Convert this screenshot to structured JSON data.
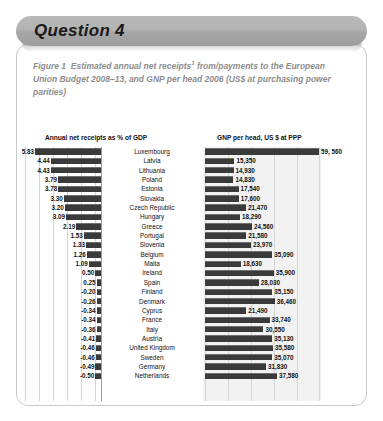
{
  "banner": {
    "title": "Question 4"
  },
  "caption": {
    "figure_label": "Figure 1",
    "text_before_sup": "Estimated annual net receipts",
    "sup": "1",
    "text_after_sup": " from/payments to the European Union Budget 2008–13, and GNP per head 2006 (US$ at purchasing power parities)"
  },
  "chart_data": {
    "type": "bar",
    "panels": [
      {
        "header": "Annual net receipts as % of GDP",
        "unit": "% of GDP",
        "xlabel": "",
        "ylabel": "",
        "xlim": [
          -0.6,
          6.0
        ],
        "grid": true
      },
      {
        "header": "GNP per head, US $ at PPP",
        "unit": "US $ at PPP",
        "xlabel": "",
        "ylabel": "",
        "xlim": [
          0,
          60000
        ],
        "grid": true
      }
    ],
    "categories": [
      "Luxembourg",
      "Latvia",
      "Lithuania",
      "Poland",
      "Estonia",
      "Slovakia",
      "Czech Republic",
      "Hungary",
      "Greece",
      "Portugal",
      "Slovenia",
      "Belgium",
      "Malta",
      "Ireland",
      "Spain",
      "Finland",
      "Denmark",
      "Cyprus",
      "France",
      "Italy",
      "Austria",
      "United Kingdom",
      "Sweden",
      "Germany",
      "Netherlands"
    ],
    "series": [
      {
        "name": "Annual net receipts as % of GDP",
        "values": [
          5.83,
          4.44,
          4.43,
          3.79,
          3.78,
          3.3,
          3.2,
          3.09,
          2.19,
          1.53,
          1.33,
          1.26,
          1.09,
          0.5,
          0.25,
          -0.2,
          -0.26,
          -0.34,
          -0.34,
          -0.36,
          -0.41,
          -0.46,
          -0.46,
          -0.49,
          -0.5
        ],
        "labels": [
          "5.83",
          "4.44",
          "4.43",
          "3.79",
          "3.78",
          "3.30",
          "3.20",
          "3.09",
          "2.19",
          "1.53",
          "1.33",
          "1.26",
          "1.09",
          "0.50",
          "0.25",
          "-0.20",
          "-0.26",
          "-0.34",
          "-0.34",
          "-0.36",
          "-0.41",
          "-0.46",
          "-0.46",
          "-0.49",
          "-0.50"
        ]
      },
      {
        "name": "GNP per head, US $ at PPP",
        "values": [
          59560,
          15350,
          14930,
          14830,
          17540,
          17600,
          21470,
          18290,
          24560,
          21580,
          23970,
          35090,
          18630,
          35900,
          28030,
          35150,
          36460,
          21490,
          33740,
          30550,
          35130,
          35580,
          35070,
          31830,
          37580
        ],
        "labels": [
          "59, 560",
          "15,350",
          "14,930",
          "14,830",
          "17,540",
          "17,600",
          "21,470",
          "18,290",
          "24,560",
          "21,580",
          "23,970",
          "35,090",
          "18,630",
          "35,900",
          "28,030",
          "35,150",
          "36,460",
          "21,490",
          "33,740",
          "30,550",
          "35,130",
          "35,580",
          "35,070",
          "31,830",
          "37,580"
        ]
      }
    ]
  }
}
